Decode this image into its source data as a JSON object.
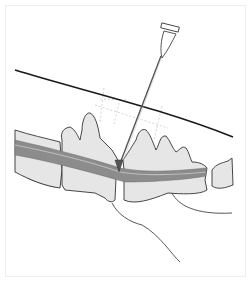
{
  "figure": {
    "title": "",
    "colors": {
      "background": "#ffffff",
      "frame": "#eeeeee",
      "outline": "#333333",
      "skin_line": "#1a1a1a",
      "bone_fill": "#e6e6e6",
      "spinal_cord_fill": "#8c8c8c",
      "spinal_cord_light": "#bdbdbd",
      "guide_dashes": "#c8c8c8",
      "needle": "#555555"
    },
    "elements": {
      "needle": "spinal-needle",
      "skin": "skin-line",
      "vertebrae": [
        "lumbar-vertebra-1",
        "lumbar-vertebra-2",
        "lumbar-vertebra-3",
        "sacrum",
        "caudal-vertebra"
      ],
      "spinal_cord": "spinal-cord",
      "guides": "landmark-guide-lines"
    }
  }
}
